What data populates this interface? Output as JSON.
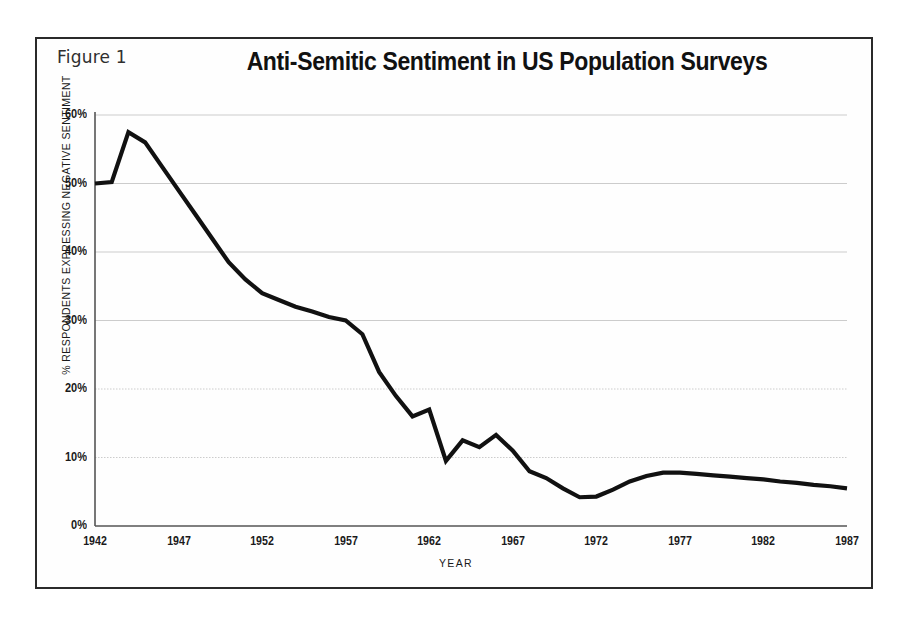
{
  "figure": {
    "label": "Figure 1",
    "title": "Anti-Semitic Sentiment in US Population Surveys"
  },
  "axes": {
    "y_title": "% RESPONDENTS EXPRESSING NEGATIVE SENTIMENT",
    "x_title": "YEAR",
    "y_ticks": [
      "0%",
      "10%",
      "20%",
      "30%",
      "40%",
      "50%",
      "60%"
    ],
    "x_ticks": [
      "1942",
      "1947",
      "1952",
      "1957",
      "1962",
      "1967",
      "1972",
      "1977",
      "1982",
      "1987"
    ]
  },
  "colors": {
    "line": "#111111",
    "frame": "#2a2a2a",
    "grid": "#cccccc",
    "axis": "#555555",
    "background": "#fefefe",
    "text": "#1a1a1a"
  },
  "chart_data": {
    "type": "line",
    "title": "Anti-Semitic Sentiment in US Population Surveys",
    "subtitle": "Figure 1",
    "xlabel": "YEAR",
    "ylabel": "% RESPONDENTS EXPRESSING NEGATIVE SENTIMENT",
    "xlim": [
      1942,
      1987
    ],
    "ylim": [
      0,
      60
    ],
    "xticks": [
      1942,
      1947,
      1952,
      1957,
      1962,
      1967,
      1972,
      1977,
      1982,
      1987
    ],
    "yticks": [
      0,
      10,
      20,
      30,
      40,
      50,
      60
    ],
    "ytick_labels": [
      "0%",
      "10%",
      "20%",
      "30%",
      "40%",
      "50%",
      "60%"
    ],
    "grid": true,
    "grid_axis": "y",
    "legend": false,
    "series": [
      {
        "name": "% respondents expressing negative sentiment",
        "x": [
          1942,
          1943,
          1944,
          1945,
          1946,
          1947,
          1948,
          1949,
          1950,
          1951,
          1952,
          1953,
          1954,
          1955,
          1956,
          1957,
          1958,
          1959,
          1960,
          1961,
          1962,
          1963,
          1964,
          1965,
          1966,
          1967,
          1968,
          1969,
          1970,
          1971,
          1972,
          1973,
          1974,
          1975,
          1976,
          1977,
          1978,
          1979,
          1980,
          1981,
          1982,
          1983,
          1984,
          1985,
          1986,
          1987
        ],
        "y": [
          50.0,
          50.2,
          57.5,
          56.0,
          52.5,
          49.0,
          45.5,
          42.0,
          38.5,
          36.0,
          34.0,
          33.0,
          32.0,
          31.3,
          30.5,
          30.0,
          28.0,
          22.5,
          19.0,
          16.0,
          17.0,
          9.5,
          12.5,
          11.5,
          13.3,
          11.0,
          8.0,
          7.0,
          5.5,
          4.2,
          4.3,
          5.3,
          6.5,
          7.3,
          7.8,
          7.8,
          7.6,
          7.4,
          7.2,
          7.0,
          6.8,
          6.5,
          6.3,
          6.0,
          5.8,
          5.5
        ]
      }
    ]
  }
}
